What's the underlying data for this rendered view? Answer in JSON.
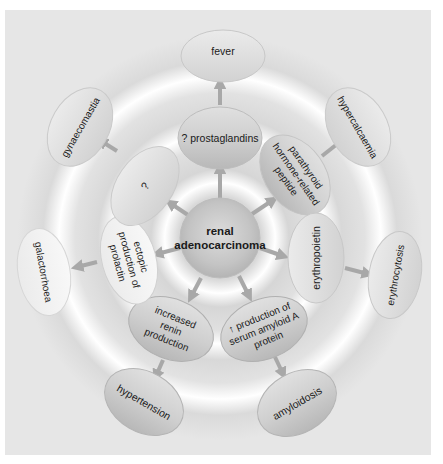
{
  "diagram": {
    "center": {
      "lines": [
        "renal",
        "adenocarcinoma"
      ]
    },
    "colors": {
      "background": "#e6e6e6",
      "ring_light": "#ffffff",
      "ring_dark": "#d2d2d2",
      "node_fill": "#c8c8c8",
      "node_light": "#f2f2f2",
      "arrow": "#a8a8a8",
      "text": "#1a1a1a"
    },
    "mediators": [
      {
        "id": "prostaglandins",
        "lines": [
          "? prostaglandins"
        ],
        "effect": "fever"
      },
      {
        "id": "pthrp",
        "lines": [
          "parathyroid",
          "hormone-related",
          "peptide"
        ],
        "effect": "hypercalcaemia"
      },
      {
        "id": "erythropoietin",
        "lines": [
          "erythropoietin"
        ],
        "effect": "erythrocytosis"
      },
      {
        "id": "saa",
        "lines": [
          "↑ production of",
          "serum amyloid A",
          "protein"
        ],
        "effect": "amyloidosis"
      },
      {
        "id": "renin",
        "lines": [
          "increased",
          "renin",
          "production"
        ],
        "effect": "hypertension"
      },
      {
        "id": "prolactin",
        "lines": [
          "ectopic",
          "production of",
          "prolactin"
        ],
        "effect": "galactorrhoea"
      },
      {
        "id": "unknown",
        "lines": [
          "?"
        ],
        "effect": "gynaecomastia"
      }
    ],
    "effects": {
      "fever": "fever",
      "hypercalcaemia": "hypercalcaemia",
      "erythrocytosis": "erythrocytosis",
      "amyloidosis": "amyloidosis",
      "hypertension": "hypertension",
      "galactorrhoea": "galactorrhoea",
      "gynaecomastia": "gynaecomastia"
    }
  }
}
